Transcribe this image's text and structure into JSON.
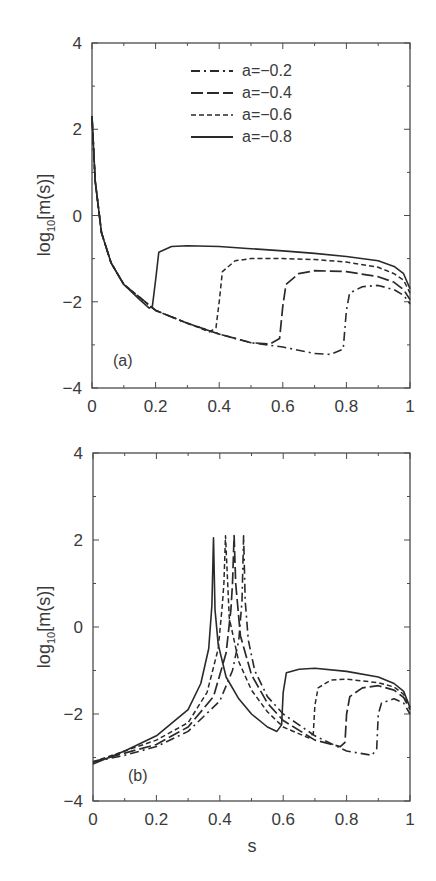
{
  "chart_data": [
    {
      "type": "line",
      "panel_label": "(a)",
      "title": "",
      "xlabel": "",
      "ylabel": "log10[m(s)]",
      "xlim": [
        0,
        1
      ],
      "ylim": [
        -4,
        4
      ],
      "xticks": [
        "0",
        "0.2",
        "0.4",
        "0.6",
        "0.8",
        "1"
      ],
      "yticks": [
        "-4",
        "-2",
        "0",
        "2",
        "4"
      ],
      "grid": false,
      "legend_position": "upper center",
      "legend": [
        "a=-0.2",
        "a=-0.4",
        "a=-0.6",
        "a=-0.8"
      ],
      "series": [
        {
          "name": "a=-0.2",
          "style": "dash-dot",
          "x": [
            0.0,
            0.01,
            0.03,
            0.06,
            0.1,
            0.15,
            0.2,
            0.3,
            0.4,
            0.5,
            0.6,
            0.7,
            0.75,
            0.79,
            0.8,
            0.81,
            0.85,
            0.9,
            0.95,
            0.98,
            1.0
          ],
          "y": [
            2.3,
            0.8,
            -0.4,
            -1.1,
            -1.6,
            -1.9,
            -2.2,
            -2.5,
            -2.75,
            -2.95,
            -3.05,
            -3.2,
            -3.22,
            -3.1,
            -2.2,
            -1.8,
            -1.65,
            -1.62,
            -1.72,
            -1.85,
            -2.05
          ]
        },
        {
          "name": "a=-0.4",
          "style": "long-dash",
          "x": [
            0.0,
            0.01,
            0.03,
            0.06,
            0.1,
            0.15,
            0.2,
            0.3,
            0.4,
            0.5,
            0.56,
            0.59,
            0.6,
            0.61,
            0.65,
            0.7,
            0.8,
            0.9,
            0.95,
            0.98,
            1.0
          ],
          "y": [
            2.3,
            0.8,
            -0.4,
            -1.1,
            -1.6,
            -1.9,
            -2.2,
            -2.5,
            -2.75,
            -2.95,
            -2.98,
            -2.85,
            -2.1,
            -1.6,
            -1.35,
            -1.28,
            -1.3,
            -1.42,
            -1.55,
            -1.72,
            -1.95
          ]
        },
        {
          "name": "a=-0.6",
          "style": "short-dash",
          "x": [
            0.0,
            0.01,
            0.03,
            0.06,
            0.1,
            0.15,
            0.2,
            0.3,
            0.37,
            0.39,
            0.4,
            0.41,
            0.45,
            0.5,
            0.6,
            0.7,
            0.8,
            0.9,
            0.95,
            0.98,
            1.0
          ],
          "y": [
            2.3,
            0.8,
            -0.4,
            -1.1,
            -1.6,
            -1.9,
            -2.2,
            -2.5,
            -2.7,
            -2.6,
            -2.0,
            -1.3,
            -1.05,
            -1.0,
            -1.0,
            -1.02,
            -1.08,
            -1.2,
            -1.35,
            -1.5,
            -1.8
          ]
        },
        {
          "name": "a=-0.8",
          "style": "solid",
          "x": [
            0.0,
            0.01,
            0.03,
            0.06,
            0.1,
            0.15,
            0.18,
            0.19,
            0.2,
            0.21,
            0.25,
            0.3,
            0.4,
            0.5,
            0.6,
            0.7,
            0.8,
            0.9,
            0.95,
            0.98,
            1.0
          ],
          "y": [
            2.3,
            0.8,
            -0.4,
            -1.1,
            -1.6,
            -1.95,
            -2.15,
            -2.1,
            -1.5,
            -0.85,
            -0.72,
            -0.7,
            -0.72,
            -0.77,
            -0.82,
            -0.88,
            -0.95,
            -1.05,
            -1.18,
            -1.35,
            -1.7
          ]
        }
      ]
    },
    {
      "type": "line",
      "panel_label": "(b)",
      "title": "",
      "xlabel": "s",
      "ylabel": "log10[m(s)]",
      "xlim": [
        0,
        1
      ],
      "ylim": [
        -4,
        4
      ],
      "xticks": [
        "0",
        "0.2",
        "0.4",
        "0.6",
        "0.8",
        "1"
      ],
      "yticks": [
        "-4",
        "-2",
        "0",
        "2",
        "4"
      ],
      "grid": false,
      "series": [
        {
          "name": "a=-0.2",
          "style": "dash-dot",
          "x": [
            0.0,
            0.1,
            0.2,
            0.3,
            0.4,
            0.44,
            0.46,
            0.47,
            0.475,
            0.48,
            0.49,
            0.51,
            0.55,
            0.6,
            0.7,
            0.8,
            0.88,
            0.895,
            0.9,
            0.91,
            0.95,
            0.98,
            1.0
          ],
          "y": [
            -3.1,
            -2.95,
            -2.75,
            -2.4,
            -1.7,
            -1.0,
            -0.3,
            0.6,
            2.1,
            0.6,
            -0.3,
            -1.0,
            -1.6,
            -2.0,
            -2.5,
            -2.85,
            -2.95,
            -2.8,
            -2.0,
            -1.75,
            -1.65,
            -1.75,
            -2.0
          ]
        },
        {
          "name": "a=-0.4",
          "style": "long-dash",
          "x": [
            0.0,
            0.1,
            0.2,
            0.3,
            0.38,
            0.42,
            0.435,
            0.44,
            0.445,
            0.45,
            0.465,
            0.5,
            0.55,
            0.6,
            0.7,
            0.78,
            0.795,
            0.8,
            0.81,
            0.85,
            0.9,
            0.95,
            0.98,
            1.0
          ],
          "y": [
            -3.1,
            -2.9,
            -2.7,
            -2.3,
            -1.6,
            -0.6,
            0.4,
            1.0,
            2.1,
            1.0,
            -0.2,
            -1.1,
            -1.75,
            -2.15,
            -2.6,
            -2.75,
            -2.65,
            -2.0,
            -1.6,
            -1.4,
            -1.35,
            -1.45,
            -1.62,
            -1.9
          ]
        },
        {
          "name": "a=-0.6",
          "style": "short-dash",
          "x": [
            0.0,
            0.1,
            0.2,
            0.3,
            0.36,
            0.395,
            0.408,
            0.413,
            0.418,
            0.43,
            0.46,
            0.5,
            0.55,
            0.6,
            0.68,
            0.695,
            0.7,
            0.71,
            0.75,
            0.8,
            0.9,
            0.95,
            0.98,
            1.0
          ],
          "y": [
            -3.1,
            -2.85,
            -2.6,
            -2.2,
            -1.5,
            -0.5,
            0.5,
            1.0,
            2.1,
            0.2,
            -0.8,
            -1.45,
            -1.95,
            -2.3,
            -2.55,
            -2.45,
            -1.8,
            -1.4,
            -1.22,
            -1.2,
            -1.28,
            -1.38,
            -1.55,
            -1.85
          ]
        },
        {
          "name": "a=-0.8",
          "style": "solid",
          "x": [
            0.0,
            0.1,
            0.2,
            0.3,
            0.34,
            0.365,
            0.375,
            0.38,
            0.385,
            0.395,
            0.42,
            0.46,
            0.5,
            0.55,
            0.58,
            0.595,
            0.6,
            0.61,
            0.65,
            0.7,
            0.8,
            0.9,
            0.95,
            0.98,
            1.0
          ],
          "y": [
            -3.15,
            -2.85,
            -2.5,
            -1.9,
            -1.3,
            -0.5,
            0.5,
            2.05,
            0.4,
            -0.4,
            -1.15,
            -1.65,
            -2.0,
            -2.3,
            -2.4,
            -2.25,
            -1.5,
            -1.05,
            -0.97,
            -0.95,
            -1.02,
            -1.15,
            -1.3,
            -1.48,
            -1.85
          ]
        }
      ]
    }
  ],
  "legend": {
    "items": [
      {
        "label": "a=−0.2",
        "style": "dash-dot"
      },
      {
        "label": "a=−0.4",
        "style": "long-dash"
      },
      {
        "label": "a=−0.6",
        "style": "short-dash"
      },
      {
        "label": "a=−0.8",
        "style": "solid"
      }
    ]
  },
  "panels": {
    "a": {
      "label": "(a)",
      "ylabel_main": "log",
      "ylabel_sub": "10",
      "ylabel_rest": "[m(s)]"
    },
    "b": {
      "label": "(b)",
      "ylabel_main": "log",
      "ylabel_sub": "10",
      "ylabel_rest": "[m(s)]",
      "xlabel": "s"
    }
  },
  "ticks": {
    "x": [
      "0",
      "0.2",
      "0.4",
      "0.6",
      "0.8",
      "1"
    ],
    "y": [
      "4",
      "2",
      "0",
      "−2",
      "−4"
    ]
  },
  "colors": {
    "ink": "#2a2a2a",
    "axis": "#4a4a4a",
    "background": "#ffffff"
  }
}
